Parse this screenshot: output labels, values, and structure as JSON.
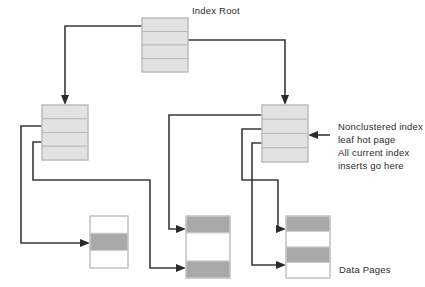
{
  "diagram": {
    "title_label": "Index Root",
    "data_pages_label": "Data Pages",
    "annotation": {
      "line1": "Nonclustered index",
      "line2": "leaf hot page",
      "line3": "All current index",
      "line4": "inserts go here"
    },
    "colors": {
      "index_cell_fill": "#e2e2e2",
      "index_cell_border": "#b9b9b9",
      "data_cell_filled": "#a9a9a9",
      "data_cell_empty": "#ffffff",
      "page_border": "#c2c2c2",
      "connector": "#3a3a3a",
      "text": "#2b2b2b",
      "background": "#ffffff"
    },
    "nodes": [
      {
        "id": "index-root",
        "kind": "index-page",
        "label": "Index Root",
        "x": 142,
        "y": 18,
        "width": 46,
        "height": 54,
        "cells": [
          "filled",
          "filled",
          "filled",
          "filled"
        ]
      },
      {
        "id": "index-leaf-left",
        "kind": "index-page",
        "label": "",
        "x": 42,
        "y": 105,
        "width": 46,
        "height": 55,
        "cells": [
          "filled",
          "filled",
          "filled",
          "filled"
        ]
      },
      {
        "id": "index-leaf-right",
        "kind": "index-page",
        "label": "",
        "x": 262,
        "y": 105,
        "width": 46,
        "height": 57,
        "cells": [
          "filled",
          "filled",
          "filled",
          "filled"
        ]
      },
      {
        "id": "data-page-left",
        "kind": "data-page",
        "label": "",
        "x": 90,
        "y": 216,
        "width": 38,
        "height": 52,
        "cells": [
          "empty",
          "filled",
          "empty"
        ]
      },
      {
        "id": "data-page-middle",
        "kind": "data-page",
        "label": "",
        "x": 186,
        "y": 216,
        "width": 44,
        "height": 62,
        "cells": [
          "filled",
          "empty",
          "filled"
        ]
      },
      {
        "id": "data-page-right",
        "kind": "data-page",
        "label": "Data Pages",
        "x": 286,
        "y": 216,
        "width": 44,
        "height": 62,
        "cells": [
          "filled",
          "empty",
          "filled",
          "empty"
        ]
      }
    ],
    "connector_count": 6
  }
}
